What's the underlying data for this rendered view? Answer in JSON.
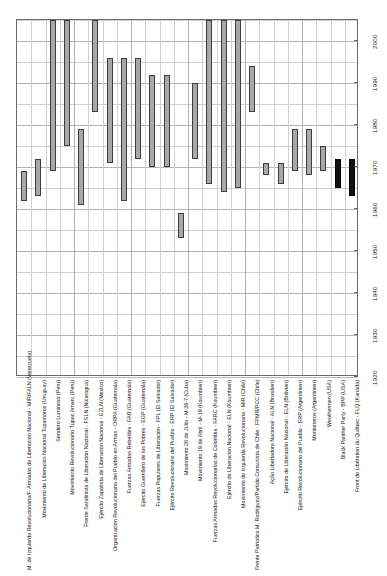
{
  "chart_data": {
    "type": "bar",
    "orientation": "vertical-timeline",
    "title": "",
    "xlabel": "",
    "ylabel": "",
    "ylim": [
      1920,
      2005
    ],
    "y_ticks": [
      1920,
      1930,
      1940,
      1950,
      1960,
      1970,
      1980,
      1990,
      2000
    ],
    "y_minor_step": 5,
    "grid": true,
    "legend": "none",
    "categories": [
      "M. de Izquierda Revolucionaria/F. Armadas de Liberación Nacional - MIR/FALN (Venezuela)",
      "Movimiento de Liberación Nacional Tupamaros (Uruguay)",
      "Sendero Luminoso (Perú)",
      "Movimiento Revolucionario Túpac Amaru (Perú)",
      "Frente Sandinista de Liberación Nacional - FSLN (Nicaragua)",
      "Ejército Zapatista de Liberación Nacional - EZLN (Mexico)",
      "Organización Revolucionaria del Pueblo en Armas - ORPA (Guatemala)",
      "Fuerzas Armadas Rebeldes - FAR (Guatemala)",
      "Ejército Guerrillero de los Pobres - EGP (Guatemala)",
      "Fuerzas Populares de Liberación - FPL (El Salvador)",
      "Ejército Revolucionario del Pueblo - ERP (El Salvador)",
      "Movimiento 26 de Julio - M-26-7 (Cuba)",
      "Movimiento 19 de Abril - M-19 (Koumbien)",
      "Fuerzas Armadas Revolucionarias de Colombia - FARC (Koumbien)",
      "Ejército de Liberación Nacional - ELN (Koumbien)",
      "Movimiento de Izquierda Revolucionaria - MIR (Chile)",
      "Frente Patriotico M. Rodriguez/Partido Comunista de Chile - FPMR/PCC (Chile)",
      "Ação Libertadora Nacional - ALN (Brasilien)",
      "Ejército de Liberación Nacional - ELN (Bolivien)",
      "Ejército Revolucionario del Pueblo - ERP (Argentinien)",
      "Montoneros (Argentinien)",
      "Weathermen (USA)",
      "Black Panther Party - BPP (USA)",
      "Front de Libération du Québec - FLQ (Kanada)"
    ],
    "bars": [
      {
        "label": "M. de Izquierda Revolucionaria/F. Armadas de Liberación Nacional - MIR/FALN (Venezuela)",
        "start": 1962,
        "end": 1969,
        "color": "#a8a8a8"
      },
      {
        "label": "Movimiento de Liberación Nacional Tupamaros (Uruguay)",
        "start": 1963,
        "end": 1972,
        "color": "#a8a8a8"
      },
      {
        "label": "Sendero Luminoso (Perú)",
        "start": 1969,
        "end": 2005,
        "color": "#a8a8a8"
      },
      {
        "label": "Movimiento Revolucionario Túpac Amaru (Perú)",
        "start": 1975,
        "end": 2005,
        "color": "#a8a8a8"
      },
      {
        "label": "Frente Sandinista de Liberación Nacional - FSLN (Nicaragua)",
        "start": 1961,
        "end": 1979,
        "color": "#a8a8a8"
      },
      {
        "label": "Ejército Zapatista de Liberación Nacional - EZLN (Mexico)",
        "start": 1983,
        "end": 2005,
        "color": "#a8a8a8"
      },
      {
        "label": "Organización Revolucionaria del Pueblo en Armas - ORPA (Guatemala)",
        "start": 1971,
        "end": 1996,
        "color": "#a8a8a8"
      },
      {
        "label": "Fuerzas Armadas Rebeldes - FAR (Guatemala)",
        "start": 1962,
        "end": 1996,
        "color": "#a8a8a8"
      },
      {
        "label": "Ejército Guerrillero de los Pobres - EGP (Guatemala)",
        "start": 1972,
        "end": 1996,
        "color": "#a8a8a8"
      },
      {
        "label": "Fuerzas Populares de Liberación - FPL (El Salvador)",
        "start": 1970,
        "end": 1992,
        "color": "#a8a8a8"
      },
      {
        "label": "Ejército Revolucionario del Pueblo - ERP (El Salvador)",
        "start": 1970,
        "end": 1992,
        "color": "#a8a8a8"
      },
      {
        "label": "Movimiento 26 de Julio - M-26-7 (Cuba)",
        "start": 1953,
        "end": 1959,
        "color": "#a8a8a8"
      },
      {
        "label": "Movimiento 19 de Abril - M-19 (Koumbien)",
        "start": 1972,
        "end": 1990,
        "color": "#a8a8a8"
      },
      {
        "label": "Fuerzas Armadas Revolucionarias de Colombia - FARC (Koumbien)",
        "start": 1966,
        "end": 2005,
        "color": "#a8a8a8"
      },
      {
        "label": "Ejército de Liberación Nacional - ELN (Koumbien)",
        "start": 1964,
        "end": 2005,
        "color": "#a8a8a8"
      },
      {
        "label": "Movimiento de Izquierda Revolucionaria - MIR (Chile)",
        "start": 1965,
        "end": 2005,
        "color": "#a8a8a8"
      },
      {
        "label": "Frente Patriotico M. Rodriguez/Partido Comunista de Chile - FPMR/PCC (Chile)",
        "start": 1983,
        "end": 1994,
        "color": "#a8a8a8"
      },
      {
        "label": "Ação Libertadora Nacional - ALN (Brasilien)",
        "start": 1968,
        "end": 1971,
        "color": "#a8a8a8"
      },
      {
        "label": "Ejército de Liberación Nacional - ELN (Bolivien)",
        "start": 1966,
        "end": 1971,
        "color": "#a8a8a8"
      },
      {
        "label": "Ejército Revolucionario del Pueblo - ERP (Argentinien)",
        "start": 1969,
        "end": 1979,
        "color": "#a8a8a8"
      },
      {
        "label": "Montoneros (Argentinien)",
        "start": 1968,
        "end": 1979,
        "color": "#a8a8a8"
      },
      {
        "label": "Weathermen (USA)",
        "start": 1969,
        "end": 1975,
        "color": "#a8a8a8"
      },
      {
        "label": "Black Panther Party - BPP (USA)",
        "start": 1965,
        "end": 1972,
        "color": "#111111"
      },
      {
        "label": "Front de Libération du Québec - FLQ (Kanada)",
        "start": 1963,
        "end": 1972,
        "color": "#111111"
      }
    ]
  }
}
